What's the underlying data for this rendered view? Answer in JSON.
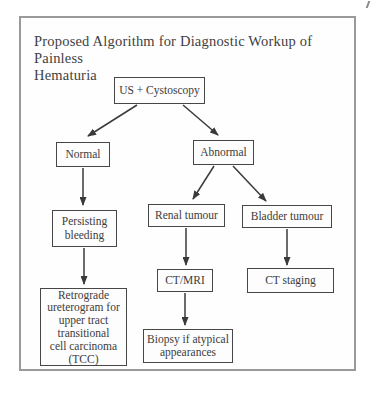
{
  "title": {
    "line1": "Proposed Algorithm for Diagnostic Workup of Painless",
    "line2": "Hematuria"
  },
  "flowchart": {
    "nodes": {
      "us_cystoscopy": {
        "label": "US + Cystoscopy"
      },
      "normal": {
        "label": "Normal"
      },
      "abnormal": {
        "label": "Abnormal"
      },
      "persisting_bleeding": {
        "label": "Persisting\nbleeding"
      },
      "renal_tumour": {
        "label": "Renal tumour"
      },
      "bladder_tumour": {
        "label": "Bladder tumour"
      },
      "ct_mri": {
        "label": "CT/MRI"
      },
      "ct_staging": {
        "label": "CT staging"
      },
      "retrograde": {
        "label": "Retrograde\nureterogram for\nupper tract\ntransitional\ncell carcinoma\n(TCC)"
      },
      "biopsy": {
        "label": "Biopsy if atypical\nappearances"
      }
    },
    "edges": [
      {
        "from": "us_cystoscopy",
        "to": "normal"
      },
      {
        "from": "us_cystoscopy",
        "to": "abnormal"
      },
      {
        "from": "normal",
        "to": "persisting_bleeding"
      },
      {
        "from": "abnormal",
        "to": "renal_tumour"
      },
      {
        "from": "abnormal",
        "to": "bladder_tumour"
      },
      {
        "from": "renal_tumour",
        "to": "ct_mri"
      },
      {
        "from": "bladder_tumour",
        "to": "ct_staging"
      },
      {
        "from": "persisting_bleeding",
        "to": "retrograde"
      },
      {
        "from": "ct_mri",
        "to": "biopsy"
      }
    ],
    "colors": {
      "box_border": "#474747",
      "text": "#3c3c3c",
      "frame_border": "#9a9a9a",
      "arrow": "#3a3a3a"
    }
  }
}
